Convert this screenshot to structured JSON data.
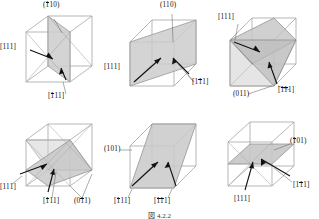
{
  "figure": {
    "caption": "図 4.2.2",
    "cube_edge_color": "#8a8a8a",
    "cube_hidden_color": "#b5b5b5",
    "plane_fill_color": "#c9c9c9",
    "plane_fill_light": "#d6d6d6",
    "arrow_color": "#111111",
    "leader_color": "#555555"
  },
  "panels": [
    {
      "id": "panel-1",
      "plane_label": {
        "pre": "(",
        "bar": "1",
        "rest": "10",
        "post": ")"
      },
      "plane_label_text": "(̄1̄10)",
      "direction_labels": [
        {
          "id": "dir-111",
          "pre": "[",
          "bar": "",
          "rest": "111",
          "post": "]"
        },
        {
          "id": "dir-1bar11",
          "pre": "[",
          "bar": "1",
          "rest": "11",
          "post": "]"
        }
      ]
    },
    {
      "id": "panel-2",
      "plane_label": {
        "pre": "(",
        "bar": "",
        "rest": "110",
        "post": ")"
      },
      "plane_label_text": "(110)",
      "direction_labels": [
        {
          "id": "dir-111",
          "pre": "[",
          "bar": "",
          "rest": "111",
          "post": "]"
        },
        {
          "id": "dir-11bar1",
          "pre": "[1",
          "bar": "1",
          "rest": "1",
          "post": "]"
        }
      ]
    },
    {
      "id": "panel-3",
      "plane_label": {
        "pre": "(",
        "bar": "",
        "rest": "011",
        "post": ")"
      },
      "plane_label_text": "(011)",
      "direction_labels": [
        {
          "id": "dir-111",
          "pre": "[",
          "bar": "",
          "rest": "111",
          "post": "]"
        },
        {
          "id": "dir-1bar1bar1",
          "pre": "[",
          "bar": "11",
          "rest": "1",
          "post": "]"
        }
      ]
    },
    {
      "id": "panel-4",
      "plane_label": {
        "pre": "(0",
        "bar": "1",
        "rest": "1",
        "post": ")"
      },
      "plane_label_text": "(0̄1̄1)",
      "direction_labels": [
        {
          "id": "dir-111",
          "pre": "[",
          "bar": "",
          "rest": "111",
          "post": "]"
        },
        {
          "id": "dir-1bar11",
          "pre": "[",
          "bar": "1",
          "rest": "11",
          "post": "]"
        }
      ]
    },
    {
      "id": "panel-5",
      "plane_label": {
        "pre": "(",
        "bar": "",
        "rest": "101",
        "post": ")"
      },
      "plane_label_text": "(101)",
      "direction_labels": [
        {
          "id": "dir-1bar11",
          "pre": "[",
          "bar": "1",
          "rest": "11",
          "post": "]"
        },
        {
          "id": "dir-1bar1bar1",
          "pre": "[",
          "bar": "11",
          "rest": "1",
          "post": "]"
        }
      ]
    },
    {
      "id": "panel-6",
      "plane_label": {
        "pre": "(",
        "bar": "1",
        "rest": "01",
        "post": ")"
      },
      "plane_label_text": "(̄1̄01)",
      "direction_labels": [
        {
          "id": "dir-111",
          "pre": "[",
          "bar": "",
          "rest": "111",
          "post": "]"
        },
        {
          "id": "dir-11bar1",
          "pre": "[1",
          "bar": "1",
          "rest": "1",
          "post": "]"
        }
      ]
    }
  ]
}
